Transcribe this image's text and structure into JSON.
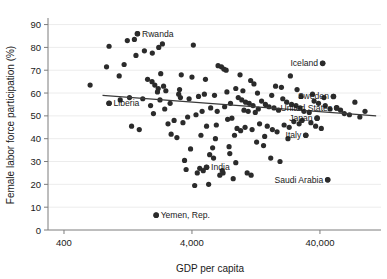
{
  "chart_data": {
    "type": "scatter",
    "title": "",
    "xlabel": "GDP per capita",
    "ylabel": "Female labor force participation (%)",
    "xscale": "log",
    "yscale": "linear",
    "xlim": [
      300,
      120000
    ],
    "ylim": [
      0,
      92
    ],
    "xticks": [
      400,
      4000,
      40000
    ],
    "xtick_labels": [
      "400",
      "4,000",
      "40,000"
    ],
    "yticks": [
      0,
      10,
      20,
      30,
      40,
      50,
      60,
      70,
      80,
      90
    ],
    "ytick_labels": [
      "0",
      "10",
      "20",
      "30",
      "40",
      "50",
      "60",
      "70",
      "80",
      "90"
    ],
    "grid": "horizontal-faint",
    "legend": "none",
    "marker_color": "#2b2b2b",
    "fit_line_color": "#3a3a3a",
    "fit_line": {
      "x_start": 800,
      "y_start": 59.0,
      "x_end": 110000,
      "y_end": 50.0,
      "label": "linear fit (downward slope)"
    },
    "annotations": [
      {
        "label": "Rwanda",
        "x": 1500,
        "y": 86.0
      },
      {
        "label": "Iceland",
        "x": 42000,
        "y": 73.0
      },
      {
        "label": "Sweden",
        "x": 51000,
        "y": 58.5
      },
      {
        "label": "United States",
        "x": 54000,
        "y": 53.5
      },
      {
        "label": "Japan",
        "x": 38000,
        "y": 49.0
      },
      {
        "label": "Italy",
        "x": 31000,
        "y": 41.5
      },
      {
        "label": "India",
        "x": 5200,
        "y": 27.5
      },
      {
        "label": "Saudi Arabia",
        "x": 46000,
        "y": 22.0
      },
      {
        "label": "Yemen, Rep.",
        "x": 2100,
        "y": 6.5
      },
      {
        "label": "Liberia",
        "x": 900,
        "y": 55.5
      }
    ],
    "points": [
      {
        "x": 640,
        "y": 63.5
      },
      {
        "x": 900,
        "y": 80.5
      },
      {
        "x": 860,
        "y": 71.5
      },
      {
        "x": 1080,
        "y": 67.5
      },
      {
        "x": 1250,
        "y": 83.0
      },
      {
        "x": 1420,
        "y": 83.5
      },
      {
        "x": 1180,
        "y": 72.5
      },
      {
        "x": 1460,
        "y": 76.5
      },
      {
        "x": 1500,
        "y": 86.0
      },
      {
        "x": 1700,
        "y": 78.5
      },
      {
        "x": 1960,
        "y": 77.5
      },
      {
        "x": 2350,
        "y": 81.5
      },
      {
        "x": 2200,
        "y": 80.0
      },
      {
        "x": 4100,
        "y": 81.0
      },
      {
        "x": 1800,
        "y": 66.0
      },
      {
        "x": 1950,
        "y": 65.0
      },
      {
        "x": 2050,
        "y": 63.5
      },
      {
        "x": 2180,
        "y": 62.0
      },
      {
        "x": 2280,
        "y": 68.5
      },
      {
        "x": 2400,
        "y": 63.0
      },
      {
        "x": 2150,
        "y": 60.5
      },
      {
        "x": 2500,
        "y": 61.0
      },
      {
        "x": 3200,
        "y": 61.5
      },
      {
        "x": 3150,
        "y": 59.5
      },
      {
        "x": 3250,
        "y": 58.0
      },
      {
        "x": 1650,
        "y": 57.5
      },
      {
        "x": 1900,
        "y": 54.5
      },
      {
        "x": 900,
        "y": 55.5
      },
      {
        "x": 2000,
        "y": 51.0
      },
      {
        "x": 6400,
        "y": 72.0
      },
      {
        "x": 6800,
        "y": 71.5
      },
      {
        "x": 7100,
        "y": 70.5
      },
      {
        "x": 7400,
        "y": 70.0
      },
      {
        "x": 9500,
        "y": 68.0
      },
      {
        "x": 11500,
        "y": 65.5
      },
      {
        "x": 42000,
        "y": 73.0
      },
      {
        "x": 5200,
        "y": 45.5
      },
      {
        "x": 6200,
        "y": 46.0
      },
      {
        "x": 7600,
        "y": 48.5
      },
      {
        "x": 8200,
        "y": 49.0
      },
      {
        "x": 8600,
        "y": 41.5
      },
      {
        "x": 4700,
        "y": 41.5
      },
      {
        "x": 6100,
        "y": 40.0
      },
      {
        "x": 5500,
        "y": 33.0
      },
      {
        "x": 5900,
        "y": 31.5
      },
      {
        "x": 3900,
        "y": 35.5
      },
      {
        "x": 4400,
        "y": 25.0
      },
      {
        "x": 4200,
        "y": 19.5
      },
      {
        "x": 6600,
        "y": 24.0
      },
      {
        "x": 7000,
        "y": 25.0
      },
      {
        "x": 2100,
        "y": 6.5
      },
      {
        "x": 9200,
        "y": 58.0
      },
      {
        "x": 9800,
        "y": 57.0
      },
      {
        "x": 10500,
        "y": 56.0
      },
      {
        "x": 11200,
        "y": 55.5
      },
      {
        "x": 12000,
        "y": 54.5
      },
      {
        "x": 10200,
        "y": 52.5
      },
      {
        "x": 11000,
        "y": 52.0
      },
      {
        "x": 12500,
        "y": 51.5
      },
      {
        "x": 13200,
        "y": 53.0
      },
      {
        "x": 14000,
        "y": 56.5
      },
      {
        "x": 15000,
        "y": 55.0
      },
      {
        "x": 16000,
        "y": 54.0
      },
      {
        "x": 17500,
        "y": 53.5
      },
      {
        "x": 19000,
        "y": 52.5
      },
      {
        "x": 20500,
        "y": 57.5
      },
      {
        "x": 22000,
        "y": 56.0
      },
      {
        "x": 24000,
        "y": 55.0
      },
      {
        "x": 26000,
        "y": 54.5
      },
      {
        "x": 28000,
        "y": 53.5
      },
      {
        "x": 30000,
        "y": 52.0
      },
      {
        "x": 33000,
        "y": 51.5
      },
      {
        "x": 36000,
        "y": 56.5
      },
      {
        "x": 39000,
        "y": 55.5
      },
      {
        "x": 44000,
        "y": 54.5
      },
      {
        "x": 48000,
        "y": 53.0
      },
      {
        "x": 51000,
        "y": 58.5
      },
      {
        "x": 54000,
        "y": 53.5
      },
      {
        "x": 58000,
        "y": 52.5
      },
      {
        "x": 62000,
        "y": 51.0
      },
      {
        "x": 68000,
        "y": 50.5
      },
      {
        "x": 75000,
        "y": 56.0
      },
      {
        "x": 82000,
        "y": 49.5
      },
      {
        "x": 90000,
        "y": 52.0
      },
      {
        "x": 38000,
        "y": 49.0
      },
      {
        "x": 31000,
        "y": 41.5
      },
      {
        "x": 46000,
        "y": 22.0
      },
      {
        "x": 9000,
        "y": 44.5
      },
      {
        "x": 9600,
        "y": 43.5
      },
      {
        "x": 10400,
        "y": 45.0
      },
      {
        "x": 11800,
        "y": 44.0
      },
      {
        "x": 13500,
        "y": 46.5
      },
      {
        "x": 15500,
        "y": 45.5
      },
      {
        "x": 17000,
        "y": 44.0
      },
      {
        "x": 18500,
        "y": 43.0
      },
      {
        "x": 21000,
        "y": 46.0
      },
      {
        "x": 23000,
        "y": 45.0
      },
      {
        "x": 25000,
        "y": 47.5
      },
      {
        "x": 27500,
        "y": 46.5
      },
      {
        "x": 29000,
        "y": 48.0
      },
      {
        "x": 34000,
        "y": 47.0
      },
      {
        "x": 37000,
        "y": 45.5
      },
      {
        "x": 41000,
        "y": 44.5
      },
      {
        "x": 5800,
        "y": 36.0
      },
      {
        "x": 7800,
        "y": 36.5
      },
      {
        "x": 12800,
        "y": 38.5
      },
      {
        "x": 14500,
        "y": 37.0
      },
      {
        "x": 16500,
        "y": 31.5
      },
      {
        "x": 19500,
        "y": 30.0
      },
      {
        "x": 8800,
        "y": 29.5
      },
      {
        "x": 5200,
        "y": 27.5
      },
      {
        "x": 4600,
        "y": 27.0
      },
      {
        "x": 4900,
        "y": 26.0
      },
      {
        "x": 3600,
        "y": 26.5
      },
      {
        "x": 6900,
        "y": 26.0
      },
      {
        "x": 10800,
        "y": 25.0
      },
      {
        "x": 11600,
        "y": 24.0
      },
      {
        "x": 8400,
        "y": 22.5
      },
      {
        "x": 5400,
        "y": 20.0
      },
      {
        "x": 2750,
        "y": 42.0
      },
      {
        "x": 3050,
        "y": 40.5
      },
      {
        "x": 2600,
        "y": 46.5
      },
      {
        "x": 2900,
        "y": 48.0
      },
      {
        "x": 3400,
        "y": 47.0
      },
      {
        "x": 3700,
        "y": 49.5
      },
      {
        "x": 4300,
        "y": 50.5
      },
      {
        "x": 4800,
        "y": 52.0
      },
      {
        "x": 5600,
        "y": 53.5
      },
      {
        "x": 6300,
        "y": 52.0
      },
      {
        "x": 7200,
        "y": 54.0
      },
      {
        "x": 8000,
        "y": 55.5
      },
      {
        "x": 2450,
        "y": 53.0
      },
      {
        "x": 2700,
        "y": 55.5
      },
      {
        "x": 1350,
        "y": 45.5
      },
      {
        "x": 1550,
        "y": 44.0
      },
      {
        "x": 2250,
        "y": 57.0
      },
      {
        "x": 3800,
        "y": 57.5
      },
      {
        "x": 4500,
        "y": 58.5
      },
      {
        "x": 5000,
        "y": 59.5
      },
      {
        "x": 6000,
        "y": 59.0
      },
      {
        "x": 7500,
        "y": 60.5
      },
      {
        "x": 8800,
        "y": 62.0
      },
      {
        "x": 10000,
        "y": 61.0
      },
      {
        "x": 13000,
        "y": 60.0
      },
      {
        "x": 16800,
        "y": 59.0
      },
      {
        "x": 20000,
        "y": 62.5
      },
      {
        "x": 26500,
        "y": 61.5
      },
      {
        "x": 3300,
        "y": 68.0
      },
      {
        "x": 4000,
        "y": 67.0
      },
      {
        "x": 5100,
        "y": 66.0
      },
      {
        "x": 12200,
        "y": 64.0
      },
      {
        "x": 18000,
        "y": 63.0
      },
      {
        "x": 23500,
        "y": 67.5
      },
      {
        "x": 1100,
        "y": 57.0
      },
      {
        "x": 1300,
        "y": 58.0
      },
      {
        "x": 28500,
        "y": 58.5
      },
      {
        "x": 35000,
        "y": 59.5
      },
      {
        "x": 43000,
        "y": 58.0
      },
      {
        "x": 3500,
        "y": 30.5
      },
      {
        "x": 7900,
        "y": 33.5
      },
      {
        "x": 22500,
        "y": 40.0
      },
      {
        "x": 14800,
        "y": 41.0
      }
    ]
  }
}
